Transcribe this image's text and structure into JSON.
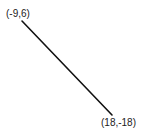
{
  "diagram": {
    "type": "line-segment",
    "line_color": "#111111",
    "start_point": {
      "label": "(-9,6)",
      "x": -9,
      "y": 6
    },
    "end_point": {
      "label": "(18,-18)",
      "x": 18,
      "y": -18
    }
  }
}
